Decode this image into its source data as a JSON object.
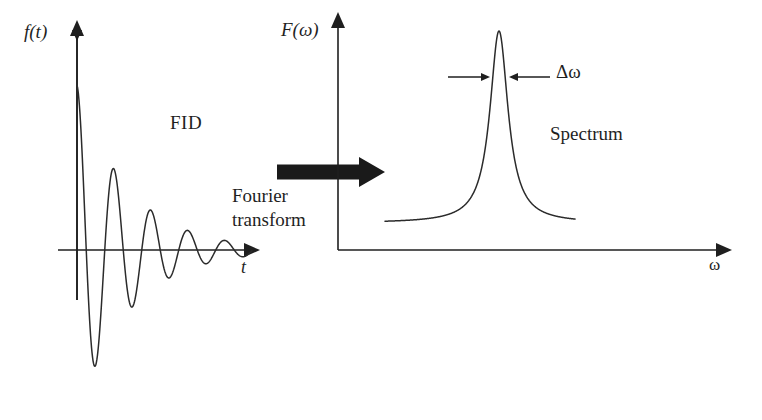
{
  "figure": {
    "background": "#ffffff",
    "stroke_color": "#262626",
    "arrow_fill": "#1a1a1a"
  },
  "labels": {
    "fid_ylabel": "f(t)",
    "fid_xlabel": "t",
    "fid_caption": "FID",
    "transform_line1": "Fourier",
    "transform_line2": "transform",
    "spectrum_ylabel": "F(ω)",
    "spectrum_xlabel": "ω",
    "linewidth_label": "Δω",
    "spectrum_caption": "Spectrum"
  },
  "chart_data": [
    {
      "type": "line",
      "name": "fid",
      "title": "FID",
      "xlabel": "t",
      "ylabel": "f(t)",
      "description": "Exponentially damped cosine oscillation (free induction decay)",
      "grid": false,
      "legend": false,
      "axis_origin_px": [
        77,
        250
      ],
      "xlim_px": [
        77,
        258
      ],
      "ylim_px": [
        22,
        410
      ],
      "model": {
        "form": "A*exp(-t/T2)*cos(2*pi*t/period)",
        "amplitude_px": 165,
        "decay_constant_px": 52,
        "period_px": 37,
        "phase": 0.0,
        "samples": 360
      },
      "peaks_px": [
        [
          88,
          96
        ],
        [
          125,
          122
        ],
        [
          161,
          158
        ],
        [
          196,
          187
        ],
        [
          230,
          203
        ]
      ],
      "troughs_px": [
        [
          107,
          390
        ],
        [
          143,
          357
        ],
        [
          178,
          322
        ],
        [
          213,
          298
        ],
        [
          245,
          275
        ]
      ]
    },
    {
      "type": "line",
      "name": "spectrum",
      "title": "Spectrum",
      "xlabel": "ω",
      "ylabel": "F(ω)",
      "description": "Single Lorentzian absorption peak on a flat baseline",
      "grid": false,
      "legend": false,
      "axis_origin_px": [
        338,
        250
      ],
      "xlim_px": [
        338,
        730
      ],
      "ylim_px": [
        14,
        250
      ],
      "model": {
        "form": "baseline + H/(1+((w-w0)/hwhm)^2)",
        "baseline_px": 223,
        "peak_center_px": 499,
        "peak_apex_px": 31,
        "half_width_half_max_px": 11,
        "curve_start_px": 385,
        "curve_end_px": 575
      },
      "annotations": [
        {
          "label": "Δω",
          "type": "width-marker",
          "left_arrow_px": [
            448,
            77,
            489,
            77
          ],
          "right_arrow_px": [
            550,
            77,
            510,
            77
          ],
          "text_px": [
            556,
            62
          ]
        }
      ]
    }
  ],
  "arrows": {
    "transform_block_arrow": {
      "name": "fourier-transform-arrow",
      "x_start_px": 277,
      "x_end_px": 385,
      "y_center_px": 172,
      "shaft_height_px": 15,
      "head_width_px": 26,
      "head_height_px": 30,
      "fill": "#1a1a1a"
    }
  }
}
